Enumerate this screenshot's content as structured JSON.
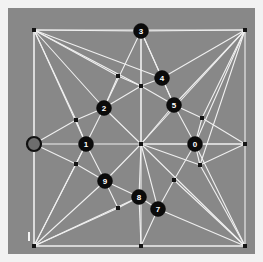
{
  "canvas": {
    "background_color": "#888888",
    "page_background_color": "#f2f2f2",
    "edge_color": "#f0f0f0",
    "vertex_color": "#141414",
    "node_fill_color": "#0b0b0b",
    "node_text_color": "#ffffff",
    "marker_fill_color": "#6e6e6e",
    "width": 247,
    "height": 246,
    "offset_x": 8,
    "offset_y": 8
  },
  "chart_data": {
    "type": "scatter",
    "title": "",
    "xlabel": "",
    "ylabel": "",
    "xlim": [
      0,
      247
    ],
    "ylim": [
      0,
      246
    ],
    "grid": false,
    "legend": false,
    "labeled_nodes": [
      {
        "label": "0",
        "x": 187,
        "y": 136
      },
      {
        "label": "1",
        "x": 78,
        "y": 136
      },
      {
        "label": "2",
        "x": 96,
        "y": 100
      },
      {
        "label": "3",
        "x": 133,
        "y": 23
      },
      {
        "label": "4",
        "x": 154,
        "y": 70
      },
      {
        "label": "5",
        "x": 166,
        "y": 97
      },
      {
        "label": "7",
        "x": 150,
        "y": 201
      },
      {
        "label": "8",
        "x": 131,
        "y": 189
      },
      {
        "label": "9",
        "x": 97,
        "y": 173
      }
    ],
    "plain_vertices": [
      {
        "x": 26,
        "y": 22
      },
      {
        "x": 237,
        "y": 22
      },
      {
        "x": 26,
        "y": 238
      },
      {
        "x": 237,
        "y": 238
      },
      {
        "x": 133,
        "y": 136
      },
      {
        "x": 133,
        "y": 78
      },
      {
        "x": 110,
        "y": 68
      },
      {
        "x": 68,
        "y": 112
      },
      {
        "x": 68,
        "y": 156
      },
      {
        "x": 194,
        "y": 110
      },
      {
        "x": 192,
        "y": 157
      },
      {
        "x": 166,
        "y": 172
      },
      {
        "x": 110,
        "y": 200
      },
      {
        "x": 133,
        "y": 238
      },
      {
        "x": 237,
        "y": 136
      },
      {
        "x": 26,
        "y": 136
      }
    ],
    "edges": [
      [
        26,
        22,
        237,
        22
      ],
      [
        26,
        22,
        26,
        238
      ],
      [
        237,
        22,
        237,
        238
      ],
      [
        26,
        238,
        237,
        238
      ],
      [
        26,
        22,
        133,
        23
      ],
      [
        133,
        23,
        237,
        22
      ],
      [
        26,
        22,
        96,
        100
      ],
      [
        26,
        22,
        78,
        136
      ],
      [
        26,
        22,
        68,
        112
      ],
      [
        26,
        22,
        133,
        78
      ],
      [
        26,
        22,
        154,
        70
      ],
      [
        26,
        22,
        110,
        68
      ],
      [
        133,
        23,
        96,
        100
      ],
      [
        133,
        23,
        133,
        78
      ],
      [
        133,
        23,
        154,
        70
      ],
      [
        133,
        23,
        166,
        97
      ],
      [
        237,
        22,
        154,
        70
      ],
      [
        237,
        22,
        166,
        97
      ],
      [
        237,
        22,
        194,
        110
      ],
      [
        237,
        22,
        187,
        136
      ],
      [
        237,
        22,
        192,
        157
      ],
      [
        237,
        22,
        133,
        136
      ],
      [
        110,
        68,
        96,
        100
      ],
      [
        110,
        68,
        133,
        78
      ],
      [
        133,
        78,
        154,
        70
      ],
      [
        133,
        78,
        166,
        97
      ],
      [
        133,
        78,
        96,
        100
      ],
      [
        133,
        78,
        133,
        136
      ],
      [
        154,
        70,
        166,
        97
      ],
      [
        166,
        97,
        194,
        110
      ],
      [
        166,
        97,
        187,
        136
      ],
      [
        166,
        97,
        133,
        136
      ],
      [
        96,
        100,
        68,
        112
      ],
      [
        96,
        100,
        78,
        136
      ],
      [
        96,
        100,
        133,
        136
      ],
      [
        68,
        112,
        78,
        136
      ],
      [
        78,
        136,
        133,
        136
      ],
      [
        78,
        136,
        68,
        156
      ],
      [
        78,
        136,
        97,
        173
      ],
      [
        78,
        136,
        26,
        136
      ],
      [
        26,
        136,
        68,
        112
      ],
      [
        26,
        136,
        68,
        156
      ],
      [
        26,
        136,
        26,
        22
      ],
      [
        26,
        136,
        26,
        238
      ],
      [
        133,
        136,
        187,
        136
      ],
      [
        133,
        136,
        97,
        173
      ],
      [
        133,
        136,
        131,
        189
      ],
      [
        133,
        136,
        150,
        201
      ],
      [
        133,
        136,
        192,
        157
      ],
      [
        133,
        136,
        237,
        136
      ],
      [
        187,
        136,
        194,
        110
      ],
      [
        187,
        136,
        192,
        157
      ],
      [
        187,
        136,
        166,
        172
      ],
      [
        187,
        136,
        237,
        136
      ],
      [
        237,
        136,
        194,
        110
      ],
      [
        237,
        136,
        192,
        157
      ],
      [
        68,
        156,
        97,
        173
      ],
      [
        97,
        173,
        110,
        200
      ],
      [
        97,
        173,
        131,
        189
      ],
      [
        110,
        200,
        131,
        189
      ],
      [
        131,
        189,
        150,
        201
      ],
      [
        131,
        189,
        133,
        238
      ],
      [
        150,
        201,
        166,
        172
      ],
      [
        150,
        201,
        133,
        238
      ],
      [
        26,
        238,
        68,
        156
      ],
      [
        26,
        238,
        97,
        173
      ],
      [
        26,
        238,
        110,
        200
      ],
      [
        26,
        238,
        131,
        189
      ],
      [
        26,
        238,
        133,
        238
      ],
      [
        26,
        238,
        78,
        136
      ],
      [
        133,
        238,
        237,
        238
      ],
      [
        237,
        238,
        166,
        172
      ],
      [
        237,
        238,
        150,
        201
      ],
      [
        237,
        238,
        192,
        157
      ],
      [
        237,
        238,
        187,
        136
      ],
      [
        237,
        238,
        133,
        136
      ],
      [
        133,
        23,
        133,
        78
      ],
      [
        133,
        78,
        133,
        136
      ],
      [
        133,
        136,
        133,
        238
      ]
    ]
  },
  "markers": {
    "left_edge_marker": {
      "name": "left-edge-marker",
      "x": 26,
      "y": 136,
      "radius": 7
    },
    "bottom_left_tick": {
      "name": "bottom-left-tick",
      "x": 20,
      "y": 224,
      "width": 2,
      "height": 9
    }
  }
}
